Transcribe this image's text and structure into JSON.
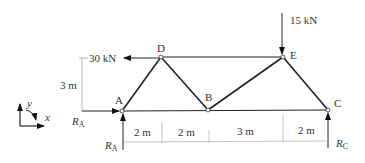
{
  "diagram": {
    "type": "truss",
    "joints": [
      {
        "id": "A",
        "label": "A",
        "x": 122,
        "y": 111
      },
      {
        "id": "D",
        "label": "D",
        "x": 161,
        "y": 57
      },
      {
        "id": "B",
        "label": "B",
        "x": 208,
        "y": 110
      },
      {
        "id": "E",
        "label": "E",
        "x": 283,
        "y": 57
      },
      {
        "id": "C",
        "label": "C",
        "x": 328,
        "y": 110
      }
    ],
    "members": [
      "AD",
      "DB",
      "BE",
      "EC",
      "DE",
      "AB",
      "BC"
    ],
    "loads": {
      "horizontal_at_D": "30 kN",
      "vertical_at_E": "15 kN"
    },
    "reactions": {
      "ra_horizontal": "R",
      "ra_horizontal_sub": "A",
      "ra_vertical": "R",
      "ra_vertical_sub": "A",
      "rc_vertical": "R",
      "rc_vertical_sub": "C"
    },
    "dimensions": {
      "height": "3 m",
      "spans": [
        "2 m",
        "2 m",
        "3 m",
        "2 m"
      ]
    },
    "axes": {
      "x_label": "x",
      "y_label": "y"
    }
  }
}
